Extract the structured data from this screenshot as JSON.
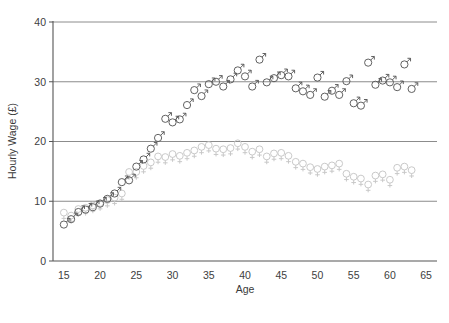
{
  "chart_data": {
    "type": "scatter",
    "title": "",
    "xlabel": "Age",
    "ylabel": "Hourly Wage (£)",
    "xlim": [
      13.5,
      66.5
    ],
    "ylim": [
      0,
      40
    ],
    "xticks": [
      15,
      20,
      25,
      30,
      35,
      40,
      45,
      50,
      55,
      60,
      65
    ],
    "yticks": [
      0,
      10,
      20,
      30,
      40
    ],
    "grid": "horizontal",
    "legend": "none",
    "series": [
      {
        "name": "Male",
        "marker": "mars-symbol",
        "color": "#595959",
        "x": [
          15,
          16,
          17,
          18,
          19,
          20,
          21,
          22,
          23,
          24,
          25,
          26,
          27,
          28,
          29,
          30,
          31,
          32,
          33,
          34,
          35,
          36,
          37,
          38,
          39,
          40,
          41,
          42,
          43,
          44,
          45,
          46,
          47,
          48,
          49,
          50,
          51,
          52,
          53,
          54,
          55,
          56,
          57,
          58,
          59,
          60,
          61,
          62,
          63
        ],
        "y": [
          6.3,
          7.2,
          8.4,
          8.8,
          9.2,
          9.8,
          10.6,
          11.5,
          13.4,
          13.7,
          16.0,
          17.2,
          19.0,
          20.8,
          24.0,
          23.4,
          23.9,
          26.3,
          28.8,
          27.8,
          29.8,
          30.2,
          29.4,
          30.6,
          32.1,
          31.1,
          29.4,
          33.9,
          30.1,
          30.8,
          31.3,
          31.1,
          29.1,
          28.6,
          28.0,
          30.9,
          27.7,
          28.7,
          28.0,
          30.3,
          26.6,
          26.2,
          33.4,
          29.7,
          30.4,
          30.1,
          29.3,
          33.1,
          29.0
        ]
      },
      {
        "name": "Female",
        "marker": "venus-symbol",
        "color": "#c6c6c6",
        "x": [
          15,
          16,
          17,
          18,
          19,
          20,
          21,
          22,
          23,
          24,
          25,
          26,
          27,
          28,
          29,
          30,
          31,
          32,
          33,
          34,
          35,
          36,
          37,
          38,
          39,
          40,
          41,
          42,
          43,
          44,
          45,
          46,
          47,
          48,
          49,
          50,
          51,
          52,
          53,
          54,
          55,
          56,
          57,
          58,
          59,
          60,
          61,
          62,
          63
        ],
        "y": [
          7.8,
          7.3,
          8.4,
          8.6,
          9.0,
          9.4,
          9.9,
          10.3,
          11.0,
          14.6,
          14.6,
          15.6,
          16.2,
          17.2,
          17.1,
          17.6,
          17.3,
          17.8,
          18.2,
          18.8,
          19.1,
          18.5,
          18.4,
          18.6,
          19.4,
          18.8,
          18.0,
          18.4,
          17.2,
          17.7,
          17.8,
          17.3,
          16.3,
          16.0,
          15.4,
          15.1,
          15.5,
          15.7,
          16.0,
          14.3,
          13.8,
          13.5,
          12.5,
          14.0,
          14.2,
          13.3,
          15.3,
          15.5,
          14.9
        ]
      }
    ]
  },
  "caption": {
    "text": ""
  }
}
